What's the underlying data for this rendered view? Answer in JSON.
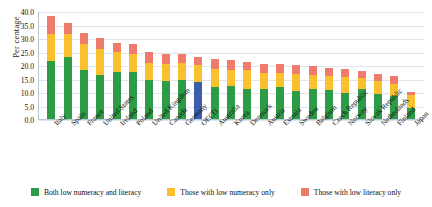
{
  "chart_data": {
    "type": "bar",
    "stacked": true,
    "title": "",
    "xlabel": "",
    "ylabel": "Per centage",
    "ylim": [
      0,
      40
    ],
    "ytick_step": 5,
    "ytick_labels": [
      "40.0",
      "35.0",
      "30.0",
      "25.0",
      "20.0",
      "15.0",
      "10.0",
      "5.0",
      "0.0"
    ],
    "grid": true,
    "legend_position": "bottom",
    "categories": [
      "Italy",
      "Spain",
      "France",
      "United States",
      "Ireland",
      "Poland",
      "United Kingdom",
      "Canada",
      "Germany",
      "OECD",
      "Australia",
      "Korea",
      "Denmark",
      "Austria",
      "Estonia",
      "Sweden",
      "Belgium",
      "Czech Republic",
      "Norway",
      "Slovak Republic",
      "Netherlands",
      "Finland",
      "Japan"
    ],
    "highlight_category": "OECD",
    "highlight_color": "#3b5fad",
    "series": [
      {
        "name": "Both low numeracy and literacy",
        "color": "#2e9b47",
        "values": [
          21.5,
          22.8,
          18.3,
          16.2,
          17.5,
          17.3,
          14.6,
          14.0,
          14.3,
          13.6,
          12.0,
          12.3,
          11.3,
          11.2,
          11.7,
          10.3,
          11.0,
          10.7,
          9.7,
          11.3,
          9.3,
          8.5,
          4.0
        ]
      },
      {
        "name": "Those with low numeracy only",
        "color": "#fbc02d",
        "values": [
          10.0,
          8.6,
          9.4,
          9.8,
          7.4,
          6.9,
          6.3,
          6.5,
          6.6,
          6.4,
          6.7,
          6.0,
          6.7,
          6.0,
          5.3,
          6.3,
          5.3,
          5.2,
          5.7,
          3.8,
          4.6,
          4.4,
          4.9
        ]
      },
      {
        "name": "Those with low literacy only",
        "color": "#ee7b6b",
        "values": [
          6.5,
          4.2,
          4.1,
          4.0,
          3.3,
          3.7,
          3.8,
          3.6,
          3.2,
          3.0,
          3.6,
          3.4,
          3.2,
          3.3,
          3.3,
          3.3,
          3.2,
          3.0,
          3.1,
          2.8,
          2.6,
          2.9,
          1.1
        ]
      }
    ]
  },
  "legend": [
    {
      "label": "Both low numeracy and literacy",
      "color": "#2e9b47"
    },
    {
      "label": "Those with low numeracy only",
      "color": "#fbc02d"
    },
    {
      "label": "Those with low literacy only",
      "color": "#ee7b6b"
    }
  ]
}
